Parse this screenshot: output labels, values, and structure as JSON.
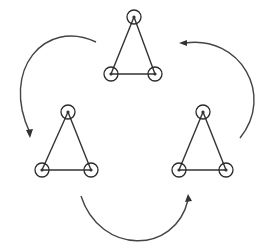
{
  "diagram": {
    "colors": {
      "stroke": "#333333",
      "background": "#ffffff"
    },
    "node_radius": 7,
    "triangles": [
      {
        "id": "top",
        "vertices": [
          [
            134,
            17
          ],
          [
            111,
            74
          ],
          [
            155,
            74
          ]
        ]
      },
      {
        "id": "left",
        "vertices": [
          [
            68,
            112
          ],
          [
            42,
            170
          ],
          [
            91,
            170
          ]
        ]
      },
      {
        "id": "right",
        "vertices": [
          [
            203,
            112
          ],
          [
            179,
            170
          ],
          [
            226,
            170
          ]
        ]
      }
    ],
    "arrows": [
      {
        "id": "top-to-left",
        "path": "M 96 42 C 45 18, 0 70, 30 133",
        "head_at": [
          30,
          133
        ],
        "head_dir": "down"
      },
      {
        "id": "left-to-right",
        "path": "M 81 196 C 100 255, 175 255, 188 200",
        "head_at": [
          188,
          200
        ],
        "head_dir": "up"
      },
      {
        "id": "right-to-top",
        "path": "M 240 138 C 275 95, 240 35, 185 43",
        "head_at": [
          185,
          43
        ],
        "head_dir": "left"
      }
    ]
  }
}
